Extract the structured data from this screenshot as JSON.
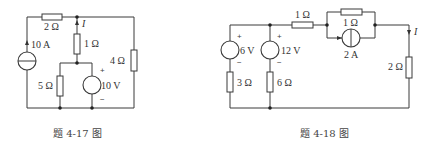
{
  "figures": [
    {
      "id": "fig-4-17",
      "caption": "题 4-17 图",
      "labels": {
        "r_top": "2 Ω",
        "r_mid": "1 Ω",
        "r_right": "4 Ω",
        "r_bottom": "5 Ω",
        "current_source": "10 A",
        "voltage_source": "10 V",
        "current_var": "I",
        "plus": "+",
        "minus": "−"
      }
    },
    {
      "id": "fig-4-18",
      "caption": "题 4-18 图",
      "labels": {
        "vs1": "6 V",
        "vs2": "12 V",
        "r_3": "3 Ω",
        "r_6": "6 Ω",
        "r_series": "1 Ω",
        "r_parallel": "1 Ω",
        "current_source": "2 A",
        "r_load": "2 Ω",
        "current_var": "I",
        "plus": "+",
        "minus": "−"
      }
    }
  ]
}
